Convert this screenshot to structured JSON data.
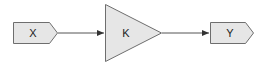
{
  "diagram": {
    "type": "block-diagram",
    "blocks": [
      {
        "id": "in",
        "kind": "input-port",
        "label": "X"
      },
      {
        "id": "gain",
        "kind": "gain",
        "label": "K"
      },
      {
        "id": "out",
        "kind": "output-port",
        "label": "Y"
      }
    ],
    "connections": [
      {
        "from": "X",
        "to": "K"
      },
      {
        "from": "K",
        "to": "Y"
      }
    ],
    "colors": {
      "fill": "#e6e6e6",
      "stroke": "#6e6e6e",
      "line": "#555555"
    }
  }
}
